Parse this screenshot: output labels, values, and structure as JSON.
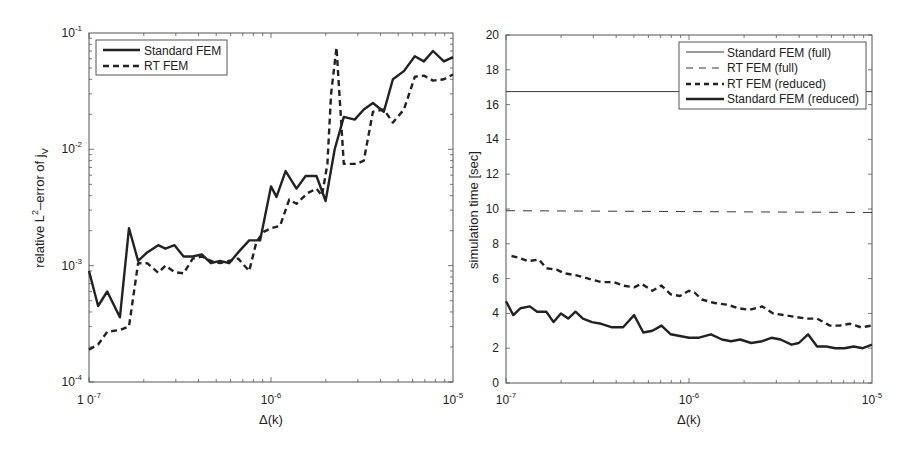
{
  "chart_data": [
    {
      "type": "line",
      "title": "",
      "xlabel": "Δ(k)",
      "ylabel": "relative L²–error of j_V",
      "ylabel_parts": {
        "main": "relative L",
        "sup": "2",
        "mid": "–error of j",
        "sub": "V"
      },
      "xscale": "log",
      "yscale": "log",
      "xlim": [
        1e-07,
        1e-05
      ],
      "ylim": [
        0.0001,
        0.1
      ],
      "grid": false,
      "legend_position": "upper left",
      "x_tick_labels": [
        {
          "value": 1e-07,
          "base": "1 0",
          "exp": "-7"
        },
        {
          "value": 1e-06,
          "base": "10",
          "exp": "-6"
        },
        {
          "value": 1e-05,
          "base": "10",
          "exp": "-5"
        }
      ],
      "y_tick_labels": [
        {
          "value": 0.1,
          "base": "10",
          "exp": "-1"
        },
        {
          "value": 0.01,
          "base": "10",
          "exp": "-2"
        },
        {
          "value": 0.001,
          "base": "10",
          "exp": "-3"
        },
        {
          "value": 0.0001,
          "base": "10",
          "exp": "-4"
        }
      ],
      "series": [
        {
          "name": "Standard FEM",
          "style": "solid-thick",
          "x_log10": [
            -7.0,
            -6.95,
            -6.9,
            -6.83,
            -6.78,
            -6.73,
            -6.68,
            -6.62,
            -6.58,
            -6.53,
            -6.48,
            -6.43,
            -6.38,
            -6.33,
            -6.28,
            -6.23,
            -6.18,
            -6.12,
            -6.06,
            -6.0,
            -5.97,
            -5.92,
            -5.86,
            -5.81,
            -5.75,
            -5.7,
            -5.65,
            -5.6,
            -5.54,
            -5.49,
            -5.44,
            -5.38,
            -5.33,
            -5.27,
            -5.21,
            -5.16,
            -5.11,
            -5.05,
            -5.0
          ],
          "y": [
            0.0009,
            0.00045,
            0.0006,
            0.00036,
            0.0021,
            0.0011,
            0.0013,
            0.0015,
            0.0014,
            0.0015,
            0.0012,
            0.0012,
            0.00125,
            0.00105,
            0.0011,
            0.00105,
            0.0013,
            0.00165,
            0.00165,
            0.0048,
            0.0039,
            0.0065,
            0.0046,
            0.0059,
            0.0059,
            0.0036,
            0.01,
            0.019,
            0.018,
            0.022,
            0.025,
            0.021,
            0.04,
            0.047,
            0.063,
            0.057,
            0.07,
            0.057,
            0.062
          ]
        },
        {
          "name": "RT FEM",
          "style": "dashed-thick",
          "x_log10": [
            -7.0,
            -6.95,
            -6.9,
            -6.83,
            -6.78,
            -6.73,
            -6.68,
            -6.62,
            -6.58,
            -6.53,
            -6.48,
            -6.43,
            -6.38,
            -6.33,
            -6.28,
            -6.23,
            -6.18,
            -6.12,
            -6.08,
            -6.04,
            -6.0,
            -5.95,
            -5.9,
            -5.86,
            -5.8,
            -5.75,
            -5.72,
            -5.69,
            -5.67,
            -5.64,
            -5.6,
            -5.53,
            -5.49,
            -5.44,
            -5.38,
            -5.33,
            -5.27,
            -5.21,
            -5.16,
            -5.11,
            -5.05,
            -5.0
          ],
          "y": [
            0.00019,
            0.00021,
            0.00027,
            0.00028,
            0.0003,
            0.00105,
            0.00105,
            0.00087,
            0.001,
            0.00088,
            0.00086,
            0.00115,
            0.0012,
            0.0011,
            0.00105,
            0.0011,
            0.00115,
            0.0009,
            0.0016,
            0.00195,
            0.0021,
            0.0022,
            0.0037,
            0.0034,
            0.0042,
            0.0046,
            0.004,
            0.0075,
            0.03,
            0.075,
            0.0075,
            0.0075,
            0.008,
            0.021,
            0.022,
            0.017,
            0.022,
            0.042,
            0.043,
            0.039,
            0.04,
            0.044
          ]
        }
      ]
    },
    {
      "type": "line",
      "title": "",
      "xlabel": "Δ(k)",
      "ylabel": "simulation time [sec]",
      "xscale": "log",
      "yscale": "linear",
      "xlim": [
        1e-07,
        1e-05
      ],
      "ylim": [
        0,
        20
      ],
      "grid": false,
      "legend_position": "upper right",
      "x_tick_labels": [
        {
          "value": 1e-07,
          "base": "10",
          "exp": "-7"
        },
        {
          "value": 1e-06,
          "base": "10",
          "exp": "-6"
        },
        {
          "value": 1e-05,
          "base": "10",
          "exp": "-5"
        }
      ],
      "y_ticks": [
        0,
        2,
        4,
        6,
        8,
        10,
        12,
        14,
        16,
        18,
        20
      ],
      "series": [
        {
          "name": "Standard FEM (full)",
          "style": "solid-thin",
          "x_log10": [
            -7.0,
            -5.0
          ],
          "y": [
            16.75,
            16.75
          ]
        },
        {
          "name": "RT FEM (full)",
          "style": "dashed-thin",
          "x_log10": [
            -7.0,
            -5.0
          ],
          "y": [
            9.9,
            9.8
          ]
        },
        {
          "name": "RT FEM (reduced)",
          "style": "dashed-thick",
          "x_log10": [
            -6.97,
            -6.93,
            -6.88,
            -6.82,
            -6.78,
            -6.72,
            -6.68,
            -6.62,
            -6.55,
            -6.48,
            -6.41,
            -6.36,
            -6.3,
            -6.26,
            -6.2,
            -6.15,
            -6.1,
            -6.05,
            -6.0,
            -5.97,
            -5.93,
            -5.86,
            -5.79,
            -5.73,
            -5.67,
            -5.6,
            -5.54,
            -5.48,
            -5.42,
            -5.36,
            -5.3,
            -5.23,
            -5.18,
            -5.12,
            -5.06,
            -5.0
          ],
          "y": [
            7.3,
            7.2,
            7.0,
            7.1,
            6.6,
            6.5,
            6.3,
            6.2,
            6.0,
            5.8,
            5.8,
            5.6,
            5.5,
            5.7,
            5.3,
            5.6,
            5.1,
            5.0,
            5.3,
            5.2,
            4.8,
            4.6,
            4.5,
            4.3,
            4.2,
            4.4,
            4.0,
            3.9,
            3.8,
            3.7,
            3.7,
            3.3,
            3.3,
            3.4,
            3.2,
            3.3
          ]
        },
        {
          "name": "Standard FEM (reduced)",
          "style": "solid-thick",
          "x_log10": [
            -7.0,
            -6.96,
            -6.92,
            -6.87,
            -6.83,
            -6.78,
            -6.74,
            -6.7,
            -6.66,
            -6.62,
            -6.58,
            -6.53,
            -6.48,
            -6.42,
            -6.36,
            -6.3,
            -6.25,
            -6.2,
            -6.15,
            -6.1,
            -6.05,
            -6.0,
            -5.95,
            -5.88,
            -5.82,
            -5.77,
            -5.72,
            -5.66,
            -5.6,
            -5.55,
            -5.5,
            -5.44,
            -5.4,
            -5.35,
            -5.3,
            -5.25,
            -5.2,
            -5.15,
            -5.1,
            -5.05,
            -5.0
          ],
          "y": [
            4.7,
            3.9,
            4.3,
            4.4,
            4.1,
            4.1,
            3.5,
            4.0,
            3.7,
            4.1,
            3.7,
            3.5,
            3.4,
            3.2,
            3.2,
            3.9,
            2.9,
            3.0,
            3.3,
            2.8,
            2.7,
            2.6,
            2.6,
            2.8,
            2.5,
            2.4,
            2.5,
            2.3,
            2.4,
            2.6,
            2.5,
            2.2,
            2.3,
            2.8,
            2.1,
            2.1,
            2.0,
            2.0,
            2.1,
            2.0,
            2.2
          ]
        }
      ]
    }
  ],
  "left_legend": {
    "items": [
      {
        "label": "Standard FEM",
        "style": "solid-thick"
      },
      {
        "label": "RT FEM",
        "style": "dashed-thick"
      }
    ]
  },
  "right_legend": {
    "items": [
      {
        "label": "Standard FEM (full)",
        "style": "solid-thin"
      },
      {
        "label": "RT FEM (full)",
        "style": "dashed-thin"
      },
      {
        "label": "RT FEM (reduced)",
        "style": "dashed-thick"
      },
      {
        "label": "Standard FEM (reduced)",
        "style": "solid-thick"
      }
    ]
  },
  "colors": {
    "line": "#222222",
    "axis": "#555555",
    "background": "#ffffff"
  }
}
